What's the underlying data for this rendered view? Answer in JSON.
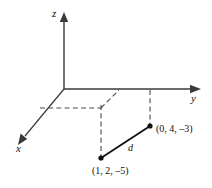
{
  "figure": {
    "axes": {
      "z_label": "z",
      "y_label": "y",
      "x_label": "x"
    },
    "segment": {
      "label": "d"
    },
    "points": [
      {
        "name": "upper-point",
        "label": "(0, 4, –3)"
      },
      {
        "name": "lower-point",
        "label": "(1, 2, –5)"
      }
    ],
    "colors": {
      "stroke": "#3a3a3a",
      "dashed": "#4a4a4a",
      "solid": "#111111",
      "text": "#111111",
      "background": "#ffffff"
    }
  }
}
